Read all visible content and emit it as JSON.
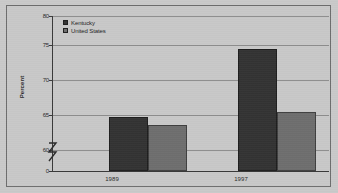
{
  "chart_data": {
    "type": "bar",
    "title": "",
    "xlabel": "",
    "ylabel": "Percent",
    "categories": [
      "1989",
      "1997"
    ],
    "series": [
      {
        "name": "Kentucky",
        "values": [
          64.9,
          75.0
        ],
        "color": "#333333"
      },
      {
        "name": "United States",
        "values": [
          63.8,
          65.6
        ],
        "color": "#6e6e6e"
      }
    ],
    "ylim": [
      60,
      80
    ],
    "yticks": [
      60,
      65,
      70,
      75,
      80
    ],
    "ytick_labels": [
      "60",
      "65",
      "70",
      "75",
      "80"
    ],
    "baseline_tick": "0",
    "axis_break": true,
    "grid": true,
    "legend_position": "top-left"
  },
  "axis": {
    "y_title": "Percent",
    "ticks": [
      {
        "label": "80",
        "value": 80
      },
      {
        "label": "75",
        "value": 75
      },
      {
        "label": "70",
        "value": 70
      },
      {
        "label": "65",
        "value": 65
      },
      {
        "label": "60",
        "value": 60
      },
      {
        "label": "0",
        "value": 0
      }
    ],
    "x_labels": [
      "1989",
      "1997"
    ]
  },
  "legend": {
    "items": [
      {
        "label": "Kentucky",
        "color": "#333333"
      },
      {
        "label": "United States",
        "color": "#6e6e6e"
      }
    ]
  },
  "colors": {
    "kentucky": "#333333",
    "united_states": "#6e6e6e",
    "plot_background": "#c8c8c8",
    "gridline": "#8d8d8d",
    "axis": "#3a3a3a",
    "frame": "#6d6d6d"
  }
}
